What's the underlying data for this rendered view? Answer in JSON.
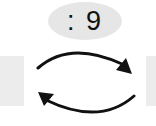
{
  "badge": {
    "label": ": 9"
  },
  "icons": {
    "swap": "swap-cycle-arrows-icon"
  },
  "colors": {
    "badge_bg": "#e6e6e6",
    "badge_text": "#111111",
    "arrow": "#111111",
    "side_block": "#ececec"
  }
}
